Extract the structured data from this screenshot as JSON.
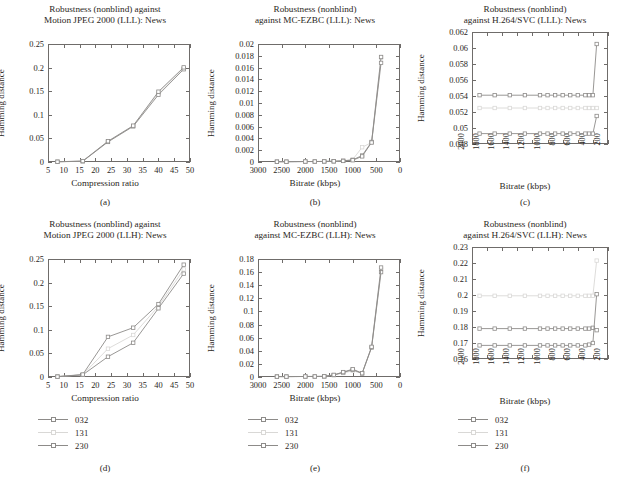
{
  "figure": {
    "legend": [
      {
        "key": "s032",
        "label": "032",
        "color": "#8d8b89"
      },
      {
        "key": "s131",
        "label": "131",
        "color": "#d9d8d6"
      },
      {
        "key": "s230",
        "label": "230",
        "color": "#8d8b89"
      }
    ]
  },
  "panels": [
    {
      "caption": "(a)",
      "title_line1": "Robustness (nonblind) against",
      "title_line2": "Motion JPEG 2000 (LLL): News",
      "chart_data": {
        "type": "line",
        "title": "Robustness (nonblind) against Motion JPEG 2000 (LLL): News",
        "xlabel": "Compression ratio",
        "ylabel": "Hamming distance",
        "xlim": [
          5,
          50
        ],
        "ylim": [
          0,
          0.25
        ],
        "xticks": [
          "5",
          "10",
          "15",
          "20",
          "25",
          "30",
          "35",
          "40",
          "45",
          "50"
        ],
        "yticks": [
          "0",
          "0.05",
          "0.1",
          "0.15",
          "0.2",
          "0.25"
        ],
        "grid": false,
        "legend_position": "below-figure",
        "x": [
          8,
          16,
          24,
          32,
          40,
          48
        ],
        "series": [
          {
            "name": "032",
            "values": [
              0.0005,
              0.0015,
              0.0425,
              0.0755,
              0.1425,
              0.1965
            ]
          },
          {
            "name": "131",
            "values": [
              0.0005,
              0.0018,
              0.0432,
              0.0762,
              0.1465,
              0.199
            ]
          },
          {
            "name": "230",
            "values": [
              0.0005,
              0.002,
              0.044,
              0.077,
              0.149,
              0.2005
            ]
          }
        ]
      }
    },
    {
      "caption": "(b)",
      "title_line1": "Robustness (nonblind)",
      "title_line2": "against MC-EZBC (LLL): News",
      "chart_data": {
        "type": "line",
        "title": "Robustness (nonblind) against MC-EZBC (LLL): News",
        "xlabel": "Bitrate (kbps)",
        "ylabel": "Hamming distance",
        "xlim": [
          3000,
          0
        ],
        "ylim": [
          0,
          0.02
        ],
        "xticks": [
          "3000",
          "2500",
          "2000",
          "1500",
          "1000",
          "500",
          "0"
        ],
        "yticks": [
          "0",
          "0.002",
          "0.004",
          "0.006",
          "0.008",
          "0.01",
          "0.012",
          "0.014",
          "0.016",
          "0.018",
          "0.02"
        ],
        "grid": false,
        "legend_position": "below-figure",
        "x": [
          2600,
          2400,
          2000,
          1800,
          1600,
          1400,
          1200,
          1000,
          800,
          600,
          400
        ],
        "series": [
          {
            "name": "032",
            "values": [
              5e-05,
              5e-05,
              8e-05,
              8e-05,
              0.0001,
              0.00012,
              0.0002,
              0.00035,
              0.0011,
              0.0034,
              0.0178
            ]
          },
          {
            "name": "131",
            "values": [
              5e-05,
              5e-05,
              8e-05,
              8e-05,
              0.0001,
              0.00012,
              0.00022,
              0.0004,
              0.0025,
              0.0033,
              0.0177
            ]
          },
          {
            "name": "230",
            "values": [
              5e-05,
              5e-05,
              8e-05,
              8e-05,
              0.0001,
              0.00012,
              0.00018,
              0.0003,
              0.00095,
              0.0033,
              0.0168
            ]
          }
        ]
      }
    },
    {
      "caption": "(c)",
      "title_line1": "Robustness (nonblind)",
      "title_line2": "against H.264/SVC (LLL): News",
      "chart_data": {
        "type": "line",
        "title": "Robustness (nonblind) against H.264/SVC (LLL): News",
        "xlabel": "Bitrate (kbps)",
        "ylabel": "Hamming distance",
        "xlim": [
          2000,
          200
        ],
        "ylim": [
          0.048,
          0.062
        ],
        "xticks": [
          "2000",
          "1800",
          "1600",
          "1400",
          "1200",
          "1000",
          "800",
          "600",
          "400",
          "200"
        ],
        "yticks": [
          "0.048",
          "0.05",
          "0.052",
          "0.054",
          "0.056",
          "0.058",
          "0.06",
          "0.062"
        ],
        "grid": false,
        "legend_position": "below-figure",
        "x": [
          1900,
          1700,
          1500,
          1300,
          1100,
          1000,
          900,
          800,
          700,
          600,
          500,
          450,
          400,
          350
        ],
        "series": [
          {
            "name": "032",
            "values": [
              0.0541,
              0.0541,
              0.0541,
              0.0541,
              0.0541,
              0.0541,
              0.0541,
              0.0541,
              0.0541,
              0.0541,
              0.0541,
              0.0541,
              0.0541,
              0.0605
            ]
          },
          {
            "name": "131",
            "values": [
              0.0525,
              0.0525,
              0.0525,
              0.0525,
              0.0525,
              0.0525,
              0.0525,
              0.0525,
              0.0525,
              0.0525,
              0.0525,
              0.0525,
              0.0525,
              0.0525
            ]
          },
          {
            "name": "230",
            "values": [
              0.0493,
              0.0493,
              0.0493,
              0.0493,
              0.0493,
              0.0493,
              0.0493,
              0.0493,
              0.0493,
              0.0493,
              0.0493,
              0.0493,
              0.0493,
              0.0515
            ]
          }
        ]
      }
    },
    {
      "caption": "(d)",
      "title_line1": "Robustness (nonblind) against",
      "title_line2": "Motion JPEG 2000 (LLH): News",
      "chart_data": {
        "type": "line",
        "title": "Robustness (nonblind) against Motion JPEG 2000 (LLH): News",
        "xlabel": "Compression ratio",
        "ylabel": "Hamming distance",
        "xlim": [
          5,
          50
        ],
        "ylim": [
          0,
          0.25
        ],
        "xticks": [
          "5",
          "10",
          "15",
          "20",
          "25",
          "30",
          "35",
          "40",
          "45",
          "50"
        ],
        "yticks": [
          "0",
          "0.05",
          "0.1",
          "0.15",
          "0.2",
          "0.25"
        ],
        "grid": false,
        "legend_position": "below-panel",
        "x": [
          8,
          16,
          24,
          32,
          40,
          48
        ],
        "series": [
          {
            "name": "032",
            "values": [
              0.0008,
              0.0045,
              0.043,
              0.0725,
              0.1455,
              0.219
            ]
          },
          {
            "name": "131",
            "values": [
              0.0008,
              0.0048,
              0.06,
              0.089,
              0.15,
              0.228
            ]
          },
          {
            "name": "230",
            "values": [
              0.0008,
              0.0052,
              0.085,
              0.1045,
              0.1545,
              0.238
            ]
          }
        ]
      }
    },
    {
      "caption": "(e)",
      "title_line1": "Robustness (nonblind)",
      "title_line2": "against MC-EZBC (LLH): News",
      "chart_data": {
        "type": "line",
        "title": "Robustness (nonblind) against MC-EZBC (LLH): News",
        "xlabel": "Bitrate (kbps)",
        "ylabel": "Hamming distance",
        "xlim": [
          3000,
          0
        ],
        "ylim": [
          0,
          0.18
        ],
        "xticks": [
          "3000",
          "2500",
          "2000",
          "1500",
          "1000",
          "500",
          "0"
        ],
        "yticks": [
          "0",
          "0.02",
          "0.04",
          "0.06",
          "0.08",
          "0.1",
          "0.12",
          "0.14",
          "0.16",
          "0.18"
        ],
        "grid": false,
        "legend_position": "below-panel",
        "x": [
          2600,
          2400,
          2000,
          1800,
          1600,
          1400,
          1200,
          1000,
          800,
          600,
          400
        ],
        "series": [
          {
            "name": "032",
            "values": [
              0.0006,
              0.0006,
              0.0008,
              0.0008,
              0.001,
              0.003,
              0.007,
              0.011,
              0.0055,
              0.045,
              0.16
            ]
          },
          {
            "name": "131",
            "values": [
              0.0006,
              0.0006,
              0.0008,
              0.0008,
              0.001,
              0.0028,
              0.006,
              0.0095,
              0.0055,
              0.0455,
              0.164
            ]
          },
          {
            "name": "230",
            "values": [
              0.0006,
              0.0006,
              0.0008,
              0.0008,
              0.001,
              0.0032,
              0.0075,
              0.012,
              0.0058,
              0.046,
              0.167
            ]
          }
        ]
      }
    },
    {
      "caption": "(f)",
      "title_line1": "Robustness (nonblind)",
      "title_line2": "against H.264/SVC (LLH): News",
      "chart_data": {
        "type": "line",
        "title": "Robustness (nonblind) against H.264/SVC (LLH): News",
        "xlabel": "Bitrate (kbps)",
        "ylabel": "Hamming distance",
        "xlim": [
          2000,
          200
        ],
        "ylim": [
          0.16,
          0.23
        ],
        "xticks": [
          "2000",
          "1800",
          "1600",
          "1400",
          "1200",
          "1000",
          "800",
          "600",
          "400",
          "200"
        ],
        "yticks": [
          "0.16",
          "0.17",
          "0.18",
          "0.19",
          "0.2",
          "0.21",
          "0.22",
          "0.23"
        ],
        "grid": false,
        "legend_position": "below-panel",
        "x": [
          1900,
          1700,
          1500,
          1300,
          1100,
          1000,
          900,
          800,
          700,
          600,
          500,
          450,
          400,
          350
        ],
        "series": [
          {
            "name": "032",
            "values": [
              0.179,
              0.179,
              0.179,
              0.179,
              0.179,
              0.179,
              0.179,
              0.179,
              0.179,
              0.179,
              0.179,
              0.179,
              0.1795,
              0.178
            ]
          },
          {
            "name": "131",
            "values": [
              0.1995,
              0.1995,
              0.1995,
              0.1995,
              0.1995,
              0.1995,
              0.1995,
              0.1995,
              0.1995,
              0.1995,
              0.1995,
              0.1995,
              0.1995,
              0.2215
            ]
          },
          {
            "name": "230",
            "values": [
              0.1685,
              0.1685,
              0.1685,
              0.1685,
              0.1685,
              0.1685,
              0.1685,
              0.1685,
              0.1685,
              0.1685,
              0.1685,
              0.169,
              0.17,
              0.2005
            ]
          }
        ]
      }
    }
  ]
}
